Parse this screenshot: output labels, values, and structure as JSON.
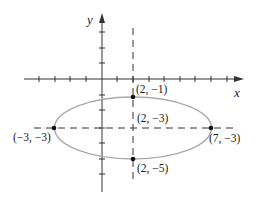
{
  "diagram": {
    "type": "ellipse-plot",
    "axes": {
      "x_label": "x",
      "y_label": "y"
    },
    "colors": {
      "axis": "#333333",
      "ellipse": "#aaaaaa",
      "dash": "#333333",
      "point": "#111111"
    },
    "ellipse": {
      "center": [
        2,
        -3
      ],
      "semi_major": 5,
      "semi_minor": 2
    },
    "points": [
      {
        "label": "(2, −1)",
        "x": 2,
        "y": -1
      },
      {
        "label": "(2, −3)",
        "x": 2,
        "y": -3
      },
      {
        "label": "(2, −5)",
        "x": 2,
        "y": -5
      },
      {
        "label": "(−3, −3)",
        "x": -3,
        "y": -3
      },
      {
        "label": "(7, −3)",
        "x": 7,
        "y": -3
      }
    ]
  }
}
